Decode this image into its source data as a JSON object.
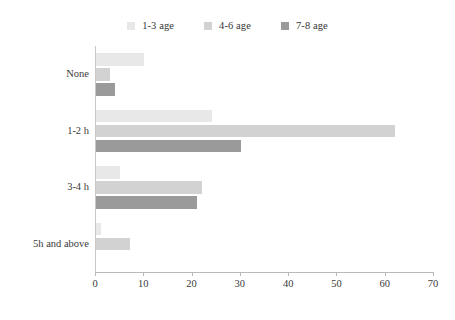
{
  "chart_data": {
    "type": "bar",
    "orientation": "horizontal",
    "title": "",
    "subtitle": "",
    "xlabel": "",
    "ylabel": "",
    "categories": [
      "None",
      "1-2 h",
      "3-4 h",
      "5h and above"
    ],
    "series": [
      {
        "name": "1-3 age",
        "color": "#e8e8e8",
        "values": [
          10,
          24,
          5,
          1
        ]
      },
      {
        "name": "4-6 age",
        "color": "#d2d2d2",
        "values": [
          3,
          62,
          22,
          7
        ]
      },
      {
        "name": "7-8 age",
        "color": "#9a9a9a",
        "values": [
          4,
          30,
          21,
          0
        ]
      }
    ],
    "xlim": [
      0,
      70
    ],
    "xticks": [
      0,
      10,
      20,
      30,
      40,
      50,
      60,
      70
    ],
    "xtick_labels": [
      "0",
      "10",
      "20",
      "30",
      "40",
      "50",
      "60",
      "70"
    ],
    "grid": false,
    "legend_position": "top-center",
    "annotations": []
  },
  "legend": {
    "entries": [
      {
        "label": "1-3 age",
        "swatch": "legend-swatch-1-3-age"
      },
      {
        "label": "4-6 age",
        "swatch": "legend-swatch-4-6-age"
      },
      {
        "label": "7-8 age",
        "swatch": "legend-swatch-7-8-age"
      }
    ]
  },
  "axes": {
    "x_tick_labels": [
      "0",
      "10",
      "20",
      "30",
      "40",
      "50",
      "60",
      "70"
    ],
    "y_tick_labels": [
      "None",
      "1-2 h",
      "3-4 h",
      "5h and above"
    ]
  }
}
